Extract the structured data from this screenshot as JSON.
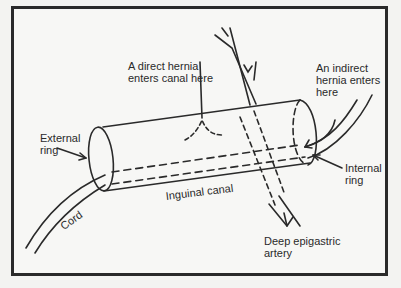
{
  "diagram": {
    "labels": {
      "direct_hernia": "A direct hernia\nenters canal here",
      "indirect_hernia": "An indirect\nhernia enters\nhere",
      "external_ring": "External\nring",
      "internal_ring": "Internal\nring",
      "inguinal_canal": "Inguinal canal",
      "cord": "Cord",
      "deep_epigastric_artery": "Deep epigastric\nartery"
    },
    "colors": {
      "ink": "#2a2a2a",
      "background": "#f7f7f5"
    }
  }
}
